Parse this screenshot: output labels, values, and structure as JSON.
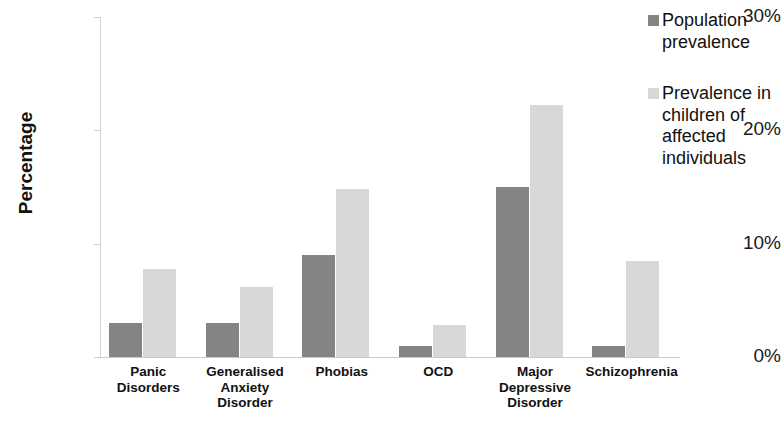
{
  "chart_data": {
    "type": "bar",
    "title": "",
    "xlabel": "",
    "ylabel": "Percentage",
    "ylim": [
      0,
      30
    ],
    "ytick_values": [
      0,
      10,
      20,
      30
    ],
    "ytick_labels": [
      "0%",
      "10%",
      "20%",
      "30%"
    ],
    "grid": false,
    "legend_position": "right",
    "categories": [
      "Panic Disorders",
      "Generalised Anxiety Disorder",
      "Phobias",
      "OCD",
      "Major Depressive Disorder",
      "Schizophrenia"
    ],
    "category_lines": [
      [
        "Panic",
        "Disorders"
      ],
      [
        "Generalised",
        "Anxiety",
        "Disorder"
      ],
      [
        "Phobias"
      ],
      [
        "OCD"
      ],
      [
        "Major",
        "Depressive",
        "Disorder"
      ],
      [
        "Schizophrenia"
      ]
    ],
    "series": [
      {
        "name": "Population prevalence",
        "name_lines": [
          "Population",
          "prevalence"
        ],
        "color": "#848484",
        "values": [
          3.0,
          3.0,
          9.0,
          1.0,
          15.0,
          1.0
        ]
      },
      {
        "name": "Prevalence in children of affected individuals",
        "name_lines": [
          "Prevalence in",
          "children of",
          "affected",
          "individuals"
        ],
        "color": "#d8d8d8",
        "values": [
          7.8,
          6.2,
          14.8,
          2.8,
          22.2,
          8.5
        ]
      }
    ]
  },
  "axis": {
    "y_title": "Percentage"
  }
}
